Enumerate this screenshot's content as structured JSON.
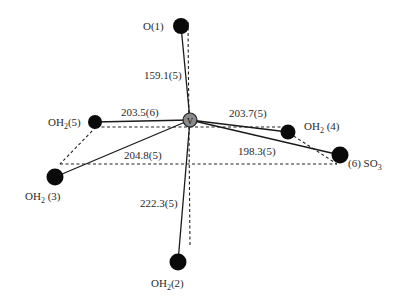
{
  "diagram": {
    "type": "coordination-geometry",
    "center_atom": {
      "label": "V",
      "x": 190,
      "y": 120
    },
    "ligands": [
      {
        "id": "O1",
        "label": "O(1)",
        "sub": "",
        "x": 181,
        "y": 26,
        "bond_length": "159.1(5)"
      },
      {
        "id": "OH2_5",
        "label": "OH",
        "sub": "2",
        "suffix": "(5)",
        "x": 95,
        "y": 122,
        "bond_length": "203.5(6)"
      },
      {
        "id": "OH2_4",
        "label": "OH",
        "sub": "2",
        "suffix": " (4)",
        "x": 288,
        "y": 132,
        "bond_length": "203.7(5)"
      },
      {
        "id": "SO3_6",
        "label": "(6) SO",
        "sub": "3",
        "suffix": "",
        "x": 340,
        "y": 155,
        "bond_length": "198.3(5)"
      },
      {
        "id": "OH2_3",
        "label": "OH",
        "sub": "2",
        "suffix": " (3)",
        "x": 55,
        "y": 177,
        "bond_length": "204.8(5)"
      },
      {
        "id": "OH2_2",
        "label": "OH",
        "sub": "2",
        "suffix": "(2)",
        "x": 178,
        "y": 262,
        "bond_length": "222.3(5)"
      }
    ],
    "bond_labels": {
      "b1": "159.1(5)",
      "b5": "203.5(6)",
      "b4": "203.7(5)",
      "b6": "198.3(5)",
      "b3": "204.8(5)",
      "b2": "222.3(5)"
    },
    "atom_labels": {
      "o1": "O(1)",
      "oh5_main": "OH",
      "oh5_sub": "2",
      "oh5_suffix": "(5)",
      "oh4_main": "OH",
      "oh4_sub": "2",
      "oh4_suffix": " (4)",
      "so3_main": "(6) SO",
      "so3_sub": "3",
      "oh3_main": "OH",
      "oh3_sub": "2",
      "oh3_suffix": " (3)",
      "oh2_main": "OH",
      "oh2_sub": "2",
      "oh2_suffix": "(2)",
      "v": "V"
    },
    "colors": {
      "atom": "#0a0a0a",
      "center_atom": "#8a8a8a",
      "bond": "#1a1a1a",
      "dashed": "#222222"
    }
  }
}
